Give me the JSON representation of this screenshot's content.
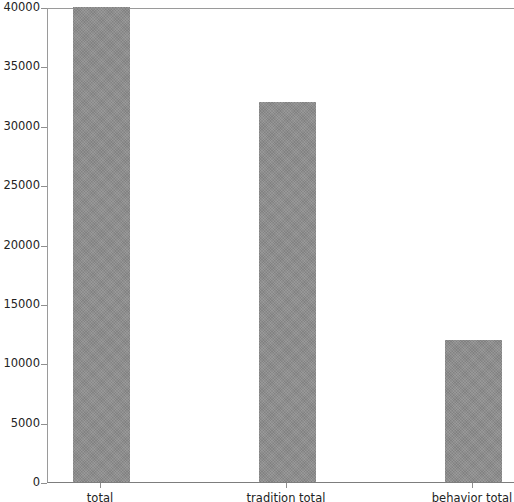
{
  "chart_data": {
    "type": "bar",
    "title": "",
    "xlabel": "",
    "ylabel": "",
    "categories": [
      "total",
      "tradition total",
      "behavior total"
    ],
    "values": [
      40000,
      32000,
      12000
    ],
    "ylim": [
      0,
      40000
    ],
    "yticks": [
      0,
      5000,
      10000,
      15000,
      20000,
      25000,
      30000,
      35000,
      40000
    ],
    "ytick_labels": [
      "0",
      "5000",
      "10000",
      "15000",
      "20000",
      "25000",
      "30000",
      "35000",
      "40000"
    ],
    "grid": false,
    "legend": null,
    "bar_color": "#8d8d8d",
    "background_color": "#ffffff",
    "axis_color": "#8f8f8f"
  }
}
